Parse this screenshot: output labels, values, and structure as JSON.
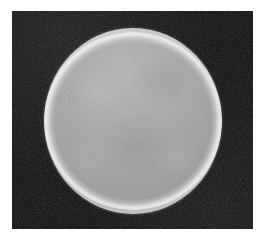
{
  "figure": {
    "caption": "",
    "subject_name": "bright circular disc",
    "medium": "grayscale photographic plate",
    "alt_text": "A bright gray circular disc with a luminous rim on a near-black rectangular field, surrounded by a white page margin.",
    "dimensions": {
      "width_px": 264,
      "height_px": 243
    }
  },
  "plate": {
    "name": "dark exposure field",
    "left_px": 12,
    "top_px": 11,
    "width_px": 241,
    "height_px": 218,
    "background_color": "#0c0c0c",
    "grain": "film-grain noise"
  },
  "disc": {
    "name": "circular disc",
    "center_x_px": 133,
    "center_y_px": 121,
    "radius_x_px": 89,
    "radius_y_px": 93,
    "fill_color": "#9b9b9b",
    "rim_highlight_color": "#e8e8e8",
    "interior_light_color": "#b2b2b2",
    "interior_dark_color": "#8e8e8e",
    "rim_brightest_sector": "upper-left",
    "surface": "subtly mottled, low-contrast texture"
  },
  "margin": {
    "name": "page margin",
    "color": "#ffffff",
    "left_px": 12,
    "top_px": 11,
    "right_px": 11,
    "bottom_px": 14
  },
  "palette": {
    "background": "#ffffff",
    "plate_black": "#0c0c0c",
    "disc_gray": "#9b9b9b",
    "rim_white": "#e8e8e8"
  }
}
